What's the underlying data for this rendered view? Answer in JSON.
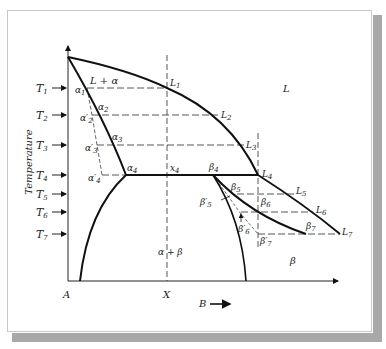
{
  "diagram": {
    "type": "binary eutectic phase diagram (non-equilibrium cooling)",
    "axes": {
      "y_label": "Temperature",
      "x_left_label": "A",
      "x_mid_label": "X",
      "x_right_label": "B",
      "x_arrow": "→"
    },
    "temperatures": [
      "T1",
      "T2",
      "T3",
      "T4",
      "T5",
      "T6",
      "T7"
    ],
    "regions": {
      "liquid": "L",
      "liquid_alpha": "L + α",
      "alpha_beta": "α + β",
      "beta": "β"
    },
    "points": {
      "L": [
        "L1",
        "L2",
        "L3",
        "L4",
        "L5",
        "L6",
        "L7"
      ],
      "alpha": [
        "α1",
        "α2",
        "α3",
        "α4"
      ],
      "alpha_prime": [
        "α'2",
        "α'3",
        "α'4"
      ],
      "beta": [
        "β4",
        "β5",
        "β6",
        "β7"
      ],
      "beta_prime": [
        "β'5",
        "β'6",
        "β'7"
      ],
      "x4": "x4"
    },
    "colors": {
      "line": "#111111",
      "dashed": "#555555",
      "shadow": "#a9a9a9"
    }
  }
}
